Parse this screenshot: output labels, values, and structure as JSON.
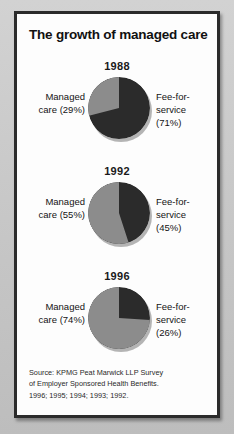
{
  "figure": {
    "title": "The growth of managed care",
    "source_lines": [
      "Source: KPMG Peat Marwick LLP Survey",
      "of Employer Sponsored Health Benefits.",
      "1996; 1995; 1994; 1993; 1992."
    ]
  },
  "colors": {
    "managed_care": "#8c8c8c",
    "fee_for_service": "#2b2b2b",
    "frame": "#2b2b2b",
    "page_background": "#c9c9c9",
    "figure_background": "#fdfdfd",
    "text": "#141414"
  },
  "panels": [
    {
      "year": "1988",
      "left_label_line1": "Managed",
      "left_label_line2": "care (29%)",
      "right_label_line1": "Fee-for-",
      "right_label_line2": "service",
      "right_label_line3": "(71%)"
    },
    {
      "year": "1992",
      "left_label_line1": "Managed",
      "left_label_line2": "care (55%)",
      "right_label_line1": "Fee-for-",
      "right_label_line2": "service",
      "right_label_line3": "(45%)"
    },
    {
      "year": "1996",
      "left_label_line1": "Managed",
      "left_label_line2": "care (74%)",
      "right_label_line1": "Fee-for-",
      "right_label_line2": "service",
      "right_label_line3": "(26%)"
    }
  ],
  "chart_data": {
    "type": "pie",
    "title": "The growth of managed care",
    "subtitle": "",
    "xlabel": "",
    "ylabel": "",
    "legend_position": "inline-labels",
    "grid": false,
    "units": "percent",
    "charts": [
      {
        "title": "1988",
        "labels": [
          "Managed care",
          "Fee-for-service"
        ],
        "values": [
          29,
          71
        ],
        "colors": [
          "#8c8c8c",
          "#2b2b2b"
        ],
        "start_angle_deg": 0,
        "direction": "counterclockwise"
      },
      {
        "title": "1992",
        "labels": [
          "Managed care",
          "Fee-for-service"
        ],
        "values": [
          55,
          45
        ],
        "colors": [
          "#8c8c8c",
          "#2b2b2b"
        ],
        "start_angle_deg": 0,
        "direction": "counterclockwise"
      },
      {
        "title": "1996",
        "labels": [
          "Managed care",
          "Fee-for-service"
        ],
        "values": [
          74,
          26
        ],
        "colors": [
          "#8c8c8c",
          "#2b2b2b"
        ],
        "start_angle_deg": 0,
        "direction": "counterclockwise"
      }
    ],
    "source": "Source: KPMG Peat Marwick LLP Survey of Employer Sponsored Health Benefits. 1996; 1995; 1994; 1993; 1992."
  }
}
